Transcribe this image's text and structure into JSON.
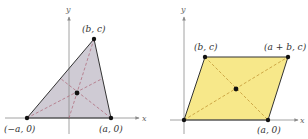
{
  "figures": [
    {
      "id": "triangle",
      "x_axis_label": "x",
      "y_axis_label": "y",
      "fill": "#cfcbd4",
      "dash_color": "#b07080",
      "vertices": [
        {
          "label": "(−a, 0)",
          "x": 27,
          "y": 118
        },
        {
          "label": "(a, 0)",
          "x": 111,
          "y": 118
        },
        {
          "label": "(b, c)",
          "x": 94,
          "y": 39
        }
      ],
      "center": {
        "x": 77,
        "y": 93
      }
    },
    {
      "id": "parallelogram",
      "x_axis_label": "x",
      "y_axis_label": "y",
      "fill": "#f7e88a",
      "dash_color": "#c8a040",
      "vertices": [
        {
          "label": "",
          "x": 184,
          "y": 120
        },
        {
          "label": "(a, 0)",
          "x": 268,
          "y": 120
        },
        {
          "label": "(a + b, c)",
          "x": 288,
          "y": 57
        },
        {
          "label": "(b, c)",
          "x": 205,
          "y": 57
        }
      ],
      "center": {
        "x": 236,
        "y": 89
      }
    }
  ],
  "labels": {
    "tri_y": "y",
    "tri_x": "x",
    "tri_bc": "(b, c)",
    "tri_neg_a0": "(−a, 0)",
    "tri_a0": "(a, 0)",
    "par_y": "y",
    "par_x": "x",
    "par_bc": "(b, c)",
    "par_abc": "(a + b, c)",
    "par_a0": "(a, 0)"
  }
}
